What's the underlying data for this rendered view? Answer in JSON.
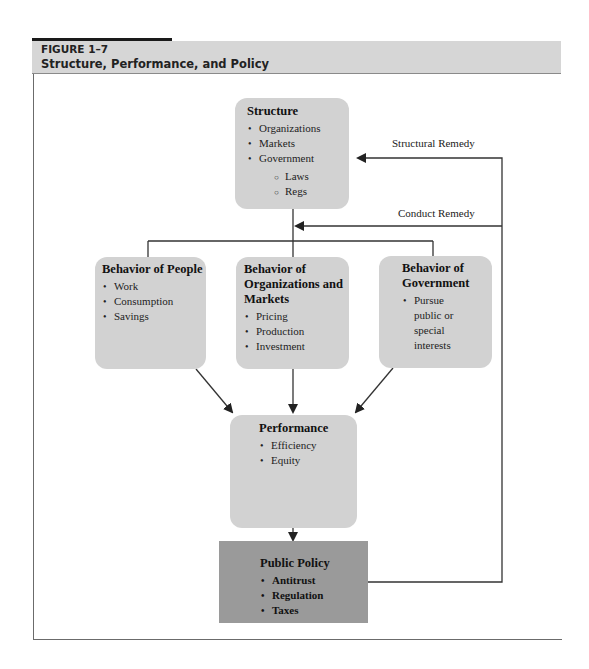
{
  "figure": {
    "number": "FIGURE 1–7",
    "title": "Structure, Performance, and Policy"
  },
  "nodes": {
    "structure": {
      "title": "Structure",
      "items": [
        "Organizations",
        "Markets",
        "Government"
      ],
      "subitems": [
        "Laws",
        "Regs"
      ]
    },
    "people": {
      "title": "Behavior of People",
      "items": [
        "Work",
        "Consumption",
        "Savings"
      ]
    },
    "organizations": {
      "title": "Behavior of Organizations and Markets",
      "items": [
        "Pricing",
        "Production",
        "Investment"
      ]
    },
    "government": {
      "title": "Behavior of Government",
      "items": [
        "Pursue public or special interests"
      ]
    },
    "performance": {
      "title": "Performance",
      "items": [
        "Efficiency",
        "Equity"
      ]
    },
    "policy": {
      "title": "Public Policy",
      "items": [
        "Antitrust",
        "Regulation",
        "Taxes"
      ]
    }
  },
  "edges": {
    "structural_remedy": "Structural Remedy",
    "conduct_remedy": "Conduct Remedy"
  },
  "colors": {
    "box_fill": "#d2d2d2",
    "policy_fill": "#9a9a9a",
    "header_band": "#d6d6d6",
    "line": "#333333"
  }
}
